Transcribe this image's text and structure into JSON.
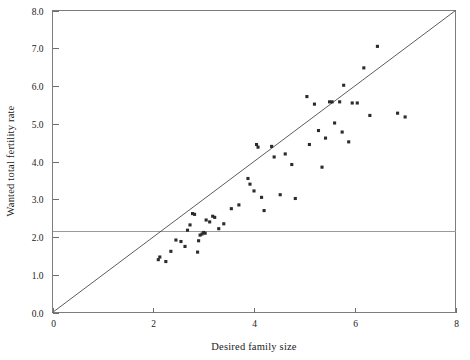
{
  "chart_data": {
    "type": "scatter",
    "title": "",
    "xlabel": "Desired family size",
    "ylabel": "Wanted total fertility rate",
    "xlim": [
      0,
      8
    ],
    "ylim": [
      0.0,
      8.0
    ],
    "xticks": [
      0,
      2,
      4,
      6,
      8
    ],
    "xtick_labels": [
      "0",
      "2",
      "4",
      "6",
      "8"
    ],
    "yticks": [
      0.0,
      1.0,
      2.0,
      3.0,
      4.0,
      5.0,
      6.0,
      7.0,
      8.0
    ],
    "ytick_labels": [
      "0.0",
      "1.0",
      "2.0",
      "3.0",
      "4.0",
      "5.0",
      "6.0",
      "7.0",
      "8.0"
    ],
    "grid": false,
    "legend": null,
    "marker": "square",
    "marker_color": "#2b2b2b",
    "reference_lines": [
      {
        "name": "identity-line",
        "type": "diagonal",
        "from": [
          0.0,
          0.0
        ],
        "to": [
          8.0,
          8.0
        ],
        "color": "#4a4a4a"
      },
      {
        "name": "replacement-level-line",
        "type": "horizontal",
        "y": 2.15,
        "color": "#9a9a9a"
      }
    ],
    "points": [
      [
        2.1,
        1.4
      ],
      [
        2.13,
        1.47
      ],
      [
        2.25,
        1.35
      ],
      [
        2.35,
        1.62
      ],
      [
        2.45,
        1.92
      ],
      [
        2.55,
        1.88
      ],
      [
        2.63,
        1.75
      ],
      [
        2.68,
        2.18
      ],
      [
        2.73,
        2.32
      ],
      [
        2.78,
        2.62
      ],
      [
        2.82,
        2.6
      ],
      [
        2.88,
        1.6
      ],
      [
        2.9,
        1.9
      ],
      [
        2.93,
        2.05
      ],
      [
        2.97,
        2.08
      ],
      [
        3.0,
        2.12
      ],
      [
        3.03,
        2.1
      ],
      [
        3.05,
        2.45
      ],
      [
        3.12,
        2.4
      ],
      [
        3.18,
        2.55
      ],
      [
        3.22,
        2.52
      ],
      [
        3.3,
        2.22
      ],
      [
        3.4,
        2.35
      ],
      [
        3.55,
        2.75
      ],
      [
        3.7,
        2.85
      ],
      [
        3.88,
        3.55
      ],
      [
        3.92,
        3.4
      ],
      [
        4.0,
        3.22
      ],
      [
        4.05,
        4.45
      ],
      [
        4.08,
        4.38
      ],
      [
        4.15,
        3.05
      ],
      [
        4.2,
        2.7
      ],
      [
        4.35,
        4.4
      ],
      [
        4.4,
        4.12
      ],
      [
        4.52,
        3.12
      ],
      [
        4.62,
        4.2
      ],
      [
        4.75,
        3.92
      ],
      [
        4.82,
        3.02
      ],
      [
        5.05,
        5.72
      ],
      [
        5.1,
        4.45
      ],
      [
        5.2,
        5.52
      ],
      [
        5.28,
        4.82
      ],
      [
        5.35,
        3.85
      ],
      [
        5.42,
        4.62
      ],
      [
        5.5,
        5.58
      ],
      [
        5.55,
        5.58
      ],
      [
        5.6,
        5.02
      ],
      [
        5.7,
        5.58
      ],
      [
        5.75,
        4.78
      ],
      [
        5.78,
        6.02
      ],
      [
        5.88,
        4.52
      ],
      [
        5.95,
        5.55
      ],
      [
        6.05,
        5.55
      ],
      [
        6.18,
        6.48
      ],
      [
        6.3,
        5.22
      ],
      [
        6.45,
        7.05
      ],
      [
        6.85,
        5.28
      ],
      [
        7.0,
        5.18
      ]
    ]
  },
  "axis": {
    "x_title": "Desired family size",
    "y_title": "Wanted total fertility rate"
  }
}
